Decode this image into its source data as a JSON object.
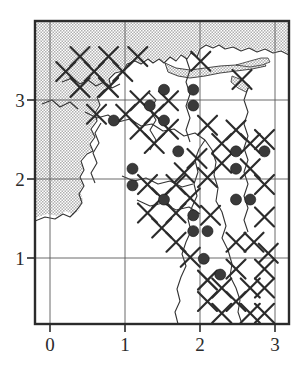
{
  "figure": {
    "type": "distribution-map"
  },
  "axes": {
    "x": {
      "label": "",
      "ticks": [
        {
          "value": 0,
          "label": "0",
          "px": 50
        },
        {
          "value": 1,
          "label": "1",
          "px": 125
        },
        {
          "value": 2,
          "label": "2",
          "px": 200
        },
        {
          "value": 3,
          "label": "3",
          "px": 275
        }
      ],
      "range": [
        -0.21,
        3.2
      ]
    },
    "y": {
      "label": "",
      "ticks": [
        {
          "value": 1,
          "label": "1",
          "px": 258
        },
        {
          "value": 2,
          "label": "2",
          "px": 179
        },
        {
          "value": 3,
          "label": "3",
          "px": 100
        }
      ],
      "range": [
        0.05,
        3.86
      ]
    }
  },
  "frame": {
    "left": 34,
    "top": 20,
    "right": 290,
    "bottom": 325
  },
  "colors": {
    "sea_fill": "#c9c9c9",
    "line": "#2b2b2b",
    "grid": "#555555",
    "dot_fill": "#3a3a3a",
    "coast": "#333333",
    "background": "#ffffff"
  },
  "chart_data": {
    "type": "scatter",
    "title": "",
    "xlabel": "",
    "ylabel": "",
    "xlim": [
      -0.21,
      3.2
    ],
    "ylim": [
      0.05,
      3.86
    ],
    "grid": true,
    "grid_spacing": 1,
    "legend": [],
    "series": [
      {
        "name": "filled-circle-records",
        "marker": "filled-circle",
        "marker_px": 11,
        "points": [
          {
            "x": 1.52,
            "y": 3.13
          },
          {
            "x": 1.91,
            "y": 3.13
          },
          {
            "x": 1.33,
            "y": 2.93
          },
          {
            "x": 1.91,
            "y": 2.93
          },
          {
            "x": 0.85,
            "y": 2.74
          },
          {
            "x": 1.52,
            "y": 2.74
          },
          {
            "x": 1.71,
            "y": 2.35
          },
          {
            "x": 2.48,
            "y": 2.35
          },
          {
            "x": 2.86,
            "y": 2.35
          },
          {
            "x": 1.1,
            "y": 2.13
          },
          {
            "x": 2.48,
            "y": 2.13
          },
          {
            "x": 1.1,
            "y": 1.92
          },
          {
            "x": 1.52,
            "y": 1.74
          },
          {
            "x": 2.48,
            "y": 1.74
          },
          {
            "x": 2.67,
            "y": 1.74
          },
          {
            "x": 1.91,
            "y": 1.54
          },
          {
            "x": 1.91,
            "y": 1.34
          },
          {
            "x": 2.1,
            "y": 1.34
          },
          {
            "x": 2.05,
            "y": 0.99
          },
          {
            "x": 2.27,
            "y": 0.79
          }
        ]
      },
      {
        "name": "cross-records",
        "marker": "cross-x",
        "marker_px": 19,
        "points": [
          {
            "x": 0.4,
            "y": 3.55
          },
          {
            "x": 0.78,
            "y": 3.55
          },
          {
            "x": 1.17,
            "y": 3.55
          },
          {
            "x": 2.01,
            "y": 3.49
          },
          {
            "x": 0.21,
            "y": 3.36
          },
          {
            "x": 0.59,
            "y": 3.36
          },
          {
            "x": 0.97,
            "y": 3.36
          },
          {
            "x": 2.56,
            "y": 3.26
          },
          {
            "x": 0.4,
            "y": 3.16
          },
          {
            "x": 0.78,
            "y": 3.16
          },
          {
            "x": 1.2,
            "y": 2.99
          },
          {
            "x": 1.58,
            "y": 2.99
          },
          {
            "x": 0.62,
            "y": 2.82
          },
          {
            "x": 1.01,
            "y": 2.82
          },
          {
            "x": 1.39,
            "y": 2.82
          },
          {
            "x": 2.1,
            "y": 2.68
          },
          {
            "x": 2.48,
            "y": 2.62
          },
          {
            "x": 1.2,
            "y": 2.63
          },
          {
            "x": 1.58,
            "y": 2.63
          },
          {
            "x": 2.86,
            "y": 2.5
          },
          {
            "x": 1.39,
            "y": 2.45
          },
          {
            "x": 2.29,
            "y": 2.45
          },
          {
            "x": 2.67,
            "y": 2.45
          },
          {
            "x": 1.96,
            "y": 2.26
          },
          {
            "x": 2.29,
            "y": 2.2
          },
          {
            "x": 2.67,
            "y": 2.13
          },
          {
            "x": 1.79,
            "y": 2.08
          },
          {
            "x": 2.1,
            "y": 2.02
          },
          {
            "x": 1.3,
            "y": 1.93
          },
          {
            "x": 1.68,
            "y": 1.93
          },
          {
            "x": 2.86,
            "y": 1.93
          },
          {
            "x": 1.49,
            "y": 1.76
          },
          {
            "x": 1.87,
            "y": 1.76
          },
          {
            "x": 1.3,
            "y": 1.57
          },
          {
            "x": 1.68,
            "y": 1.57
          },
          {
            "x": 2.14,
            "y": 1.54
          },
          {
            "x": 2.86,
            "y": 1.52
          },
          {
            "x": 1.49,
            "y": 1.38
          },
          {
            "x": 1.68,
            "y": 1.2
          },
          {
            "x": 2.48,
            "y": 1.2
          },
          {
            "x": 2.72,
            "y": 1.2
          },
          {
            "x": 2.91,
            "y": 1.06
          },
          {
            "x": 1.87,
            "y": 1.01
          },
          {
            "x": 2.48,
            "y": 0.86
          },
          {
            "x": 2.86,
            "y": 0.86
          },
          {
            "x": 2.1,
            "y": 0.72
          },
          {
            "x": 2.29,
            "y": 0.62
          },
          {
            "x": 2.67,
            "y": 0.62
          },
          {
            "x": 2.86,
            "y": 0.62
          },
          {
            "x": 2.1,
            "y": 0.45
          },
          {
            "x": 2.48,
            "y": 0.45
          },
          {
            "x": 2.29,
            "y": 0.3
          },
          {
            "x": 2.67,
            "y": 0.3
          },
          {
            "x": 2.86,
            "y": 0.3
          }
        ]
      }
    ]
  }
}
